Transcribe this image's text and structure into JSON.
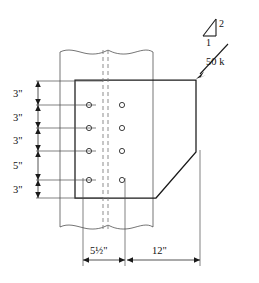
{
  "figure": {
    "type": "engineering-drawing"
  },
  "load": {
    "magnitude_label": "50 k",
    "slope_rise_label": "2",
    "slope_run_label": "1"
  },
  "vertical_dimensions": [
    {
      "label": "3\"",
      "value": 3,
      "unit": "in"
    },
    {
      "label": "3\"",
      "value": 3,
      "unit": "in"
    },
    {
      "label": "3\"",
      "value": 3,
      "unit": "in"
    },
    {
      "label": "5\"",
      "value": 5,
      "unit": "in"
    },
    {
      "label": "3\"",
      "value": 3,
      "unit": "in"
    }
  ],
  "horizontal_dimensions": [
    {
      "label": "5½\"",
      "value": 5.5,
      "unit": "in"
    },
    {
      "label": "12\"",
      "value": 12,
      "unit": "in"
    }
  ],
  "bolt_holes": {
    "columns": 2,
    "rows": 4,
    "total": 8
  },
  "colors": {
    "outline": "#1a1a1a",
    "thin": "#3a3a3a",
    "centerline": "#7a7a7a",
    "background": "#ffffff"
  }
}
